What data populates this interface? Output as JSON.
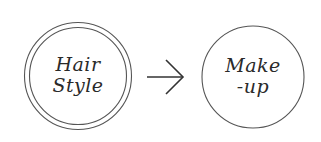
{
  "diagram": {
    "nodes": [
      {
        "id": "hair-style",
        "lines": [
          "Hair",
          "Style"
        ],
        "border": "double"
      },
      {
        "id": "make-up",
        "lines": [
          "Make",
          "-up"
        ],
        "border": "single"
      }
    ],
    "edges": [
      {
        "from": "hair-style",
        "to": "make-up",
        "type": "arrow"
      }
    ],
    "colors": {
      "stroke": "#555555",
      "text": "#2a2a2a",
      "background": "#ffffff"
    }
  }
}
